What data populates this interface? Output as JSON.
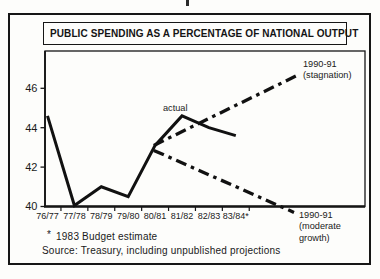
{
  "chart_data": {
    "type": "line",
    "title": "PUBLIC SPENDING AS A PERCENTAGE OF NATIONAL OUTPUT",
    "categories": [
      "76/77",
      "77/78",
      "78/79",
      "79/80",
      "80/81",
      "81/82",
      "82/83",
      "83/84*"
    ],
    "series": [
      {
        "name": "actual",
        "values": [
          44.6,
          40.05,
          41.0,
          40.5,
          43.1,
          44.6,
          44.0,
          43.6
        ]
      }
    ],
    "projections": [
      {
        "name": "stagnation",
        "label_lines": [
          "1990-91",
          "(stagnation)"
        ],
        "start_year_index": 3.95,
        "start_value": 43.1,
        "end_value": 46.65,
        "line_style": "dash-dot"
      },
      {
        "name": "moderate-growth",
        "label_lines": [
          "1990-91",
          "(moderate",
          "growth)"
        ],
        "start_year_index": 3.95,
        "start_value": 42.85,
        "end_value": 39.7,
        "line_style": "dash-dot"
      }
    ],
    "yticks": [
      40,
      42,
      44,
      46
    ],
    "ylim": [
      40,
      47.5
    ],
    "xlabel": "",
    "ylabel": "",
    "grid": false,
    "legend_position": "none",
    "annotations": {
      "actual_label": "actual"
    }
  },
  "notes": {
    "footnote_marker": "*",
    "footnote_text": "1983 Budget estimate",
    "source": "Source: Treasury, including unpublished projections"
  },
  "colors": {
    "ink": "#1a1a1a",
    "line": "#111111",
    "frame": "#161616",
    "background": "#fdfdfb"
  }
}
